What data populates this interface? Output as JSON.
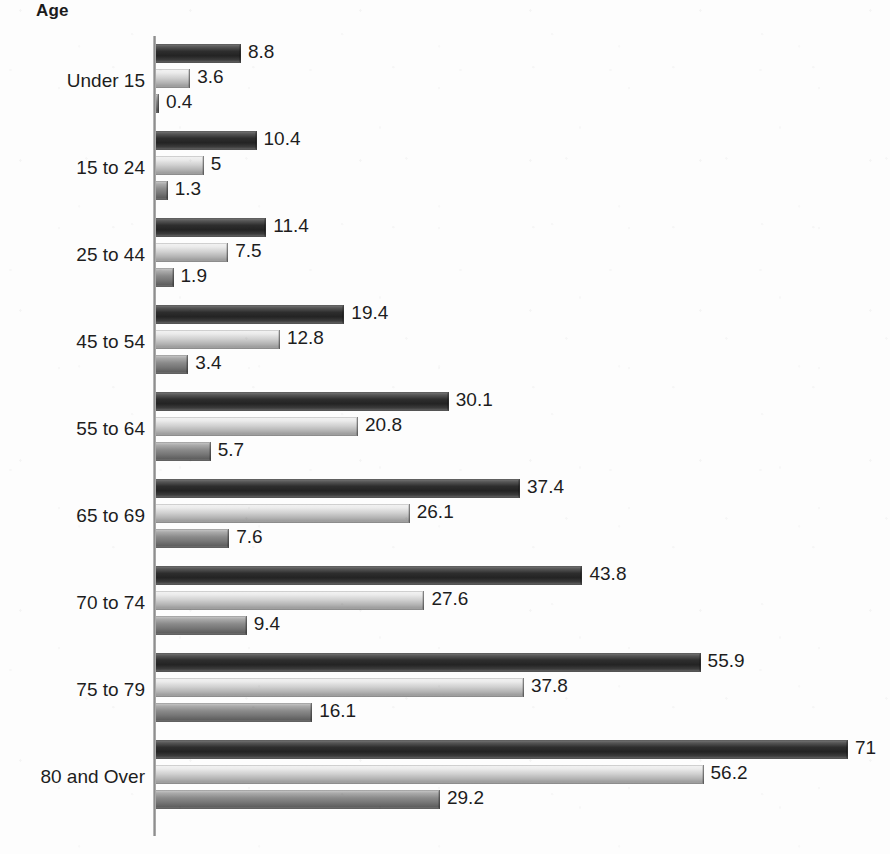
{
  "chart_data": {
    "type": "bar",
    "orientation": "horizontal",
    "title": "Age",
    "xlabel": "",
    "ylabel": "Age",
    "grid": false,
    "legend": "none",
    "xlim": [
      0,
      75
    ],
    "axis_line_value": 0,
    "categories": [
      "Under 15",
      "15 to 24",
      "25 to 44",
      "45 to 54",
      "55 to 64",
      "65 to 69",
      "70 to 74",
      "75 to 79",
      "80 and Over"
    ],
    "series": [
      {
        "name": "series-1",
        "color": "#2e2e2e",
        "values": [
          8.8,
          10.4,
          11.4,
          19.4,
          30.1,
          37.4,
          43.8,
          55.9,
          71
        ],
        "labels": [
          "8.8",
          "10.4",
          "11.4",
          "19.4",
          "30.1",
          "37.4",
          "43.8",
          "55.9",
          "71"
        ]
      },
      {
        "name": "series-2",
        "color": "#cfcfcf",
        "values": [
          3.6,
          5,
          7.5,
          12.8,
          20.8,
          26.1,
          27.6,
          37.8,
          56.2
        ],
        "labels": [
          "3.6",
          "5",
          "7.5",
          "12.8",
          "20.8",
          "26.1",
          "27.6",
          "37.8",
          "56.2"
        ]
      },
      {
        "name": "series-3",
        "color": "#8a8a8a",
        "values": [
          0.4,
          1.3,
          1.9,
          3.4,
          5.7,
          7.6,
          9.4,
          16.1,
          29.2
        ],
        "labels": [
          "0.4",
          "1.3",
          "1.9",
          "3.4",
          "5.7",
          "7.6",
          "9.4",
          "16.1",
          "29.2"
        ]
      }
    ]
  },
  "layout": {
    "axis_x_px": 154,
    "px_per_unit": 9.76,
    "first_bar_top_px": 44,
    "bar_height_px": 19,
    "bar_gap_px": 6,
    "group_pitch_px": 87
  }
}
